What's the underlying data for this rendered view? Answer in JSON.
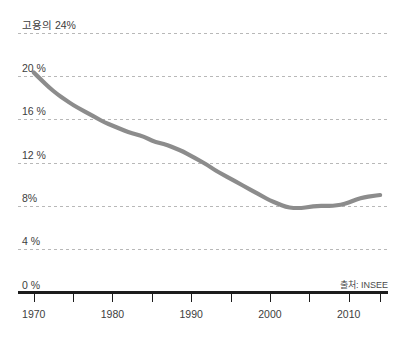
{
  "chart_data": {
    "type": "line",
    "title": "고용의 24%",
    "subtitle": "",
    "xlabel": "",
    "ylabel": "",
    "source": "출처: INSEE",
    "grid": true,
    "legend": false,
    "legend_position": "none",
    "line_color": "#8c8c8c",
    "axis_color": "#1c1c1c",
    "grid_color": "#b8b8b8",
    "xlim": [
      1968,
      2015
    ],
    "ylim": [
      0,
      24
    ],
    "yticks": [
      0,
      4,
      8,
      12,
      16,
      20,
      24
    ],
    "ytick_labels": [
      "0 %",
      "4 %",
      "8%",
      "12 %",
      "16 %",
      "20 %",
      "고용의 24%"
    ],
    "xticks": [
      1970,
      1980,
      1990,
      2000,
      2010
    ],
    "xtick_labels": [
      "1970",
      "1980",
      "1990",
      "2000",
      "2010"
    ],
    "xminor_ticks": [
      1975,
      1985,
      1995,
      2005,
      2014
    ],
    "x": [
      1970,
      1971,
      1972,
      1973,
      1974,
      1975,
      1976,
      1977,
      1978,
      1979,
      1980,
      1981,
      1982,
      1983,
      1984,
      1985,
      1986,
      1987,
      1988,
      1989,
      1990,
      1991,
      1992,
      1993,
      1994,
      1995,
      1996,
      1997,
      1998,
      1999,
      2000,
      2001,
      2002,
      2003,
      2004,
      2005,
      2006,
      2007,
      2008,
      2009,
      2010,
      2011,
      2012,
      2013,
      2014
    ],
    "values": [
      20.3,
      19.6,
      18.9,
      18.3,
      17.8,
      17.3,
      16.9,
      16.5,
      16.1,
      15.7,
      15.4,
      15.1,
      14.8,
      14.6,
      14.4,
      14.0,
      13.8,
      13.6,
      13.3,
      13.0,
      12.6,
      12.2,
      11.8,
      11.3,
      10.9,
      10.5,
      10.1,
      9.7,
      9.3,
      8.9,
      8.5,
      8.2,
      7.9,
      7.8,
      7.8,
      7.9,
      8.0,
      8.0,
      8.0,
      8.1,
      8.3,
      8.6,
      8.8,
      8.9,
      9.0
    ],
    "series": [
      {
        "name": "고용의 비중",
        "color": "#8c8c8c",
        "values": [
          20.3,
          19.6,
          18.9,
          18.3,
          17.8,
          17.3,
          16.9,
          16.5,
          16.1,
          15.7,
          15.4,
          15.1,
          14.8,
          14.6,
          14.4,
          14.0,
          13.8,
          13.6,
          13.3,
          13.0,
          12.6,
          12.2,
          11.8,
          11.3,
          10.9,
          10.5,
          10.1,
          9.7,
          9.3,
          8.9,
          8.5,
          8.2,
          7.9,
          7.8,
          7.8,
          7.9,
          8.0,
          8.0,
          8.0,
          8.1,
          8.3,
          8.6,
          8.8,
          8.9,
          9.0
        ]
      }
    ]
  }
}
